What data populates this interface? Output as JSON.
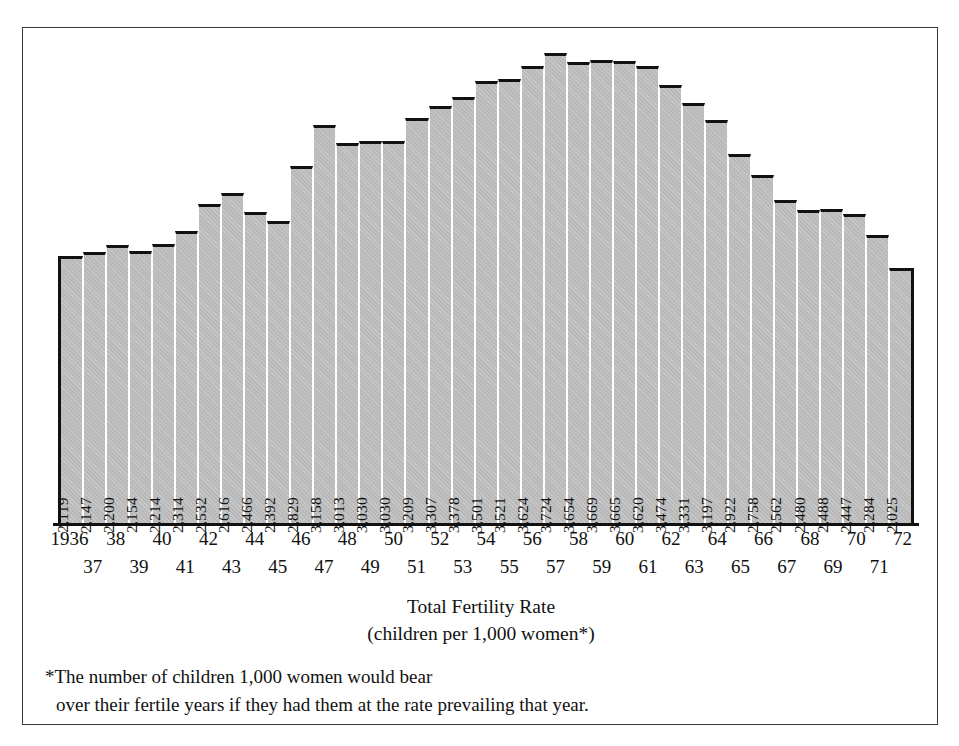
{
  "chart_data": {
    "type": "bar",
    "title": "",
    "xlabel": "Total Fertility Rate",
    "xlabel_sub": "(children per 1,000 women*)",
    "ylabel": "",
    "grid": false,
    "legend": "none",
    "orientation": "vertical-step-columns",
    "ylim": [
      0,
      3900
    ],
    "categories": [
      "1936",
      "37",
      "38",
      "39",
      "40",
      "41",
      "42",
      "43",
      "44",
      "45",
      "46",
      "47",
      "48",
      "49",
      "50",
      "51",
      "52",
      "53",
      "54",
      "55",
      "56",
      "57",
      "58",
      "59",
      "60",
      "61",
      "62",
      "63",
      "64",
      "65",
      "66",
      "67",
      "68",
      "69",
      "70",
      "71",
      "72"
    ],
    "full_years": [
      1936,
      1937,
      1938,
      1939,
      1940,
      1941,
      1942,
      1943,
      1944,
      1945,
      1946,
      1947,
      1948,
      1949,
      1950,
      1951,
      1952,
      1953,
      1954,
      1955,
      1956,
      1957,
      1958,
      1959,
      1960,
      1961,
      1962,
      1963,
      1964,
      1965,
      1966,
      1967,
      1968,
      1969,
      1970,
      1971,
      1972
    ],
    "values": [
      2119,
      2147,
      2200,
      2154,
      2214,
      2314,
      2532,
      2616,
      2466,
      2392,
      2829,
      3158,
      3013,
      3030,
      3030,
      3209,
      3307,
      3378,
      3501,
      3521,
      3624,
      3724,
      3654,
      3669,
      3665,
      3620,
      3474,
      3331,
      3197,
      2922,
      2758,
      2562,
      2480,
      2488,
      2447,
      2284,
      2025
    ],
    "value_labels": [
      "2,119",
      "2,147",
      "2,200",
      "2,154",
      "2,214",
      "2,314",
      "2,532",
      "2,616",
      "2,466",
      "2,392",
      "2,829",
      "3,158",
      "3,013",
      "3,030",
      "3,030",
      "3,209",
      "3,307",
      "3,378",
      "3,501",
      "3,521",
      "3,624",
      "3,724",
      "3,654",
      "3,669",
      "3,665",
      "3,620",
      "3,474",
      "3,331",
      "3,197",
      "2,922",
      "2,758",
      "2,562",
      "2,480",
      "2,488",
      "2,447",
      "2,284",
      "2,025"
    ],
    "colors": {
      "bar_fill": "#b9b9b9",
      "bar_outline": "#111111",
      "bar_separator": "#fdfdfd",
      "text": "#111111",
      "frame": "#3a3a3a",
      "background": "#ffffff"
    }
  },
  "footnote": {
    "line1": "*The number of children 1,000 women would bear",
    "line2": "over their fertile years if they had them at  the rate prevailing that year."
  }
}
